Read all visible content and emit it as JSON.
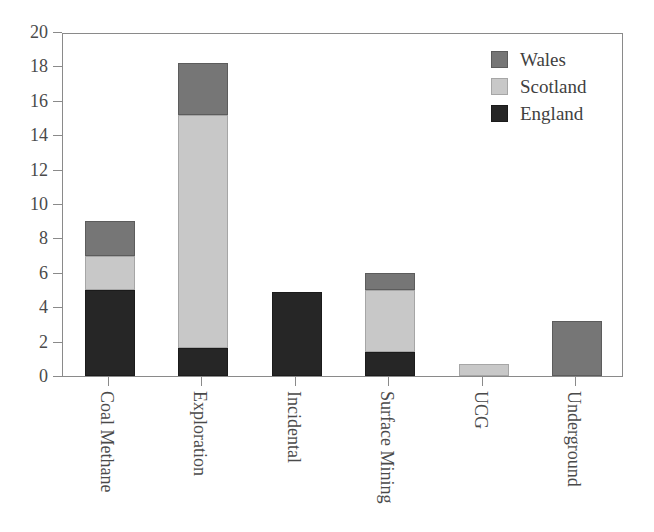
{
  "chart_data": {
    "type": "bar",
    "stacked": true,
    "title": "",
    "xlabel": "",
    "ylabel": "",
    "categories": [
      "Coal Methane",
      "Exploration",
      "Incidental",
      "Surface Mining",
      "UCG",
      "Underground"
    ],
    "series": [
      {
        "name": "England",
        "color": "#262626",
        "values": [
          5.0,
          1.6,
          4.9,
          1.4,
          0.0,
          0.0
        ]
      },
      {
        "name": "Scotland",
        "color": "#c8c8c8",
        "values": [
          2.0,
          13.6,
          0.0,
          3.6,
          0.7,
          0.0
        ]
      },
      {
        "name": "Wales",
        "color": "#767676",
        "values": [
          2.0,
          3.0,
          0.0,
          1.0,
          0.0,
          3.2
        ]
      }
    ],
    "totals": [
      9.0,
      18.2,
      4.9,
      6.0,
      0.7,
      3.2
    ],
    "ylim": [
      0,
      20
    ],
    "yticks": [
      0,
      2,
      4,
      6,
      8,
      10,
      12,
      14,
      16,
      18,
      20
    ],
    "ytick_labels": [
      "0",
      "2",
      "4",
      "6",
      "8",
      "10",
      "12",
      "14",
      "16",
      "18",
      "20"
    ],
    "grid": false,
    "legend_position": "top-right",
    "legend_order": [
      "Wales",
      "Scotland",
      "England"
    ],
    "xtick_label_rotation": 90
  },
  "legend": {
    "entries": [
      {
        "label": "Wales",
        "swatch": "wales"
      },
      {
        "label": "Scotland",
        "swatch": "scotland"
      },
      {
        "label": "England",
        "swatch": "england"
      }
    ]
  },
  "colors": {
    "england": "#262626",
    "scotland": "#c8c8c8",
    "wales": "#767676",
    "axis": "#8a8a8a",
    "text": "#4a4a4a",
    "background": "#ffffff"
  }
}
